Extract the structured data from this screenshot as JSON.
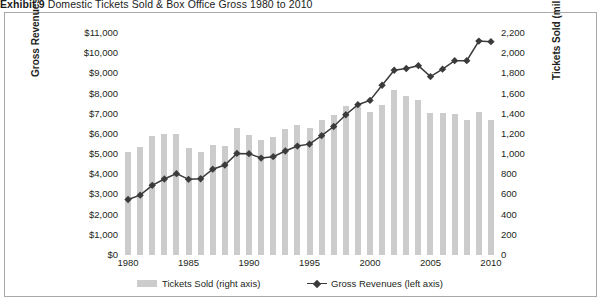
{
  "exhibit": {
    "label": "Exhibit 9",
    "title": "Domestic Tickets Sold & Box Office Gross 1980 to 2010"
  },
  "legend": {
    "bars_label": "Tickets Sold (right axis)",
    "line_label": "Gross Revenues (left axis)"
  },
  "colors": {
    "bar": "#cccccc",
    "line": "#3b3b3b",
    "frame": "#a9a9a9",
    "text": "#231f20"
  },
  "chart_data": {
    "type": "bar",
    "title": "Domestic Tickets Sold & Box Office Gross 1980 to 2010",
    "xlabel": "",
    "grid": false,
    "legend_position": "bottom",
    "categories": [
      "1980",
      "1981",
      "1982",
      "1983",
      "1984",
      "1985",
      "1986",
      "1987",
      "1988",
      "1989",
      "1990",
      "1991",
      "1992",
      "1993",
      "1994",
      "1995",
      "1996",
      "1997",
      "1998",
      "1999",
      "2000",
      "2001",
      "2002",
      "2003",
      "2004",
      "2005",
      "2006",
      "2007",
      "2008",
      "2009",
      "2010"
    ],
    "x_tick_labels": [
      "1980",
      "1985",
      "1990",
      "1995",
      "2000",
      "2005",
      "2010"
    ],
    "left_axis": {
      "label": "Gross Revenues (mil. $)",
      "ylim": [
        0,
        11000
      ],
      "ticks": [
        0,
        1000,
        2000,
        3000,
        4000,
        5000,
        6000,
        7000,
        8000,
        9000,
        10000,
        11000
      ],
      "tick_labels": [
        "$0",
        "$1,000",
        "$2,000",
        "$3,000",
        "$4,000",
        "$5,000",
        "$6,000",
        "$7,000",
        "$8,000",
        "$9,000",
        "$10,000",
        "$11,000"
      ]
    },
    "right_axis": {
      "label": "Tickets Sold (mil. #)",
      "ylim": [
        0,
        2200
      ],
      "ticks": [
        0,
        200,
        400,
        600,
        800,
        1000,
        1200,
        1400,
        1600,
        1800,
        2000,
        2200
      ],
      "tick_labels": [
        "0",
        "200",
        "400",
        "600",
        "800",
        "1,000",
        "1,200",
        "1,400",
        "1,600",
        "1,800",
        "2,000",
        "2,200"
      ]
    },
    "series": [
      {
        "name": "Tickets Sold (right axis)",
        "type": "bar",
        "axis": "right",
        "unit": "mil. #",
        "values": [
          1022,
          1067,
          1176,
          1197,
          1199,
          1056,
          1017,
          1089,
          1085,
          1263,
          1189,
          1141,
          1173,
          1244,
          1292,
          1263,
          1339,
          1388,
          1481,
          1465,
          1421,
          1487,
          1639,
          1574,
          1536,
          1403,
          1406,
          1400,
          1341,
          1419,
          1339
        ]
      },
      {
        "name": "Gross Revenues (left axis)",
        "type": "line",
        "axis": "left",
        "unit": "mil. $",
        "marker": "diamond",
        "values": [
          2749,
          2966,
          3453,
          3766,
          4031,
          3749,
          3778,
          4253,
          4458,
          5033,
          5022,
          4803,
          4871,
          5154,
          5396,
          5494,
          5912,
          6366,
          6949,
          7448,
          7661,
          8413,
          9155,
          9240,
          9380,
          8840,
          9209,
          9630,
          9630,
          10600,
          10570
        ]
      }
    ]
  }
}
